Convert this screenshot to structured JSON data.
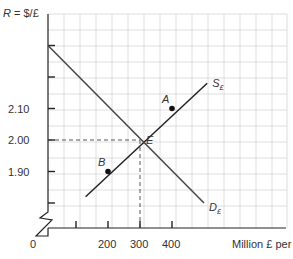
{
  "chart_data": {
    "type": "line",
    "title": "",
    "ylabel": "R = $/£",
    "xlabel": "Million £ per day",
    "origin_label": "0",
    "x_ticks": [
      {
        "value": 100,
        "label": ""
      },
      {
        "value": 200,
        "label": "200"
      },
      {
        "value": 300,
        "label": "300"
      },
      {
        "value": 400,
        "label": "400"
      }
    ],
    "y_ticks": [
      {
        "value": 2.3,
        "label": ""
      },
      {
        "value": 2.2,
        "label": ""
      },
      {
        "value": 2.1,
        "label": "2.10"
      },
      {
        "value": 2.0,
        "label": "2.00"
      },
      {
        "value": 1.9,
        "label": "1.90"
      },
      {
        "value": 1.8,
        "label": ""
      }
    ],
    "xlim": [
      0,
      750
    ],
    "ylim": [
      1.7,
      2.4
    ],
    "grid": true,
    "axis_break": "y",
    "series": [
      {
        "name": "S£",
        "label": "S",
        "subscript": "£",
        "kind": "supply",
        "x": [
          130,
          510
        ],
        "y": [
          1.82,
          2.18
        ],
        "color": "#222222"
      },
      {
        "name": "D£",
        "label": "D",
        "subscript": "£",
        "kind": "demand",
        "x": [
          0,
          500
        ],
        "y": [
          2.3,
          1.8
        ],
        "color": "#444444"
      }
    ],
    "points": [
      {
        "name": "A",
        "x": 400,
        "y": 2.1
      },
      {
        "name": "B",
        "x": 200,
        "y": 1.9
      },
      {
        "name": "E",
        "x": 300,
        "y": 2.0
      }
    ],
    "annotations": [
      {
        "type": "dashed-guide",
        "from": [
          0,
          2.0
        ],
        "to": [
          300,
          2.0
        ]
      },
      {
        "type": "dashed-guide",
        "from": [
          300,
          0
        ],
        "to": [
          300,
          2.0
        ]
      }
    ]
  }
}
